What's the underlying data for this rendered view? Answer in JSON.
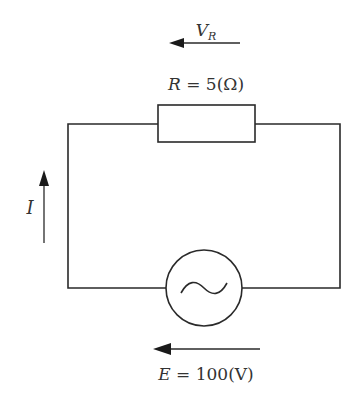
{
  "diagram": {
    "type": "circuit",
    "colors": {
      "line": "#2a2a2a",
      "text": "#333333",
      "background": "#ffffff"
    },
    "labels": {
      "voltage_resistor": {
        "symbol": "V",
        "subscript": "R"
      },
      "resistor": {
        "symbol": "R",
        "equals": " = ",
        "value": "5(Ω)"
      },
      "current": {
        "symbol": "I"
      },
      "source": {
        "symbol": "E",
        "equals": " = ",
        "value": "100(V)"
      }
    },
    "components": [
      {
        "name": "resistor",
        "label": "R = 5(Ω)"
      },
      {
        "name": "ac-voltage-source",
        "label": "E = 100(V)"
      }
    ],
    "arrows": [
      {
        "name": "voltage-resistor-arrow",
        "direction": "left",
        "label": "V_R"
      },
      {
        "name": "current-arrow",
        "direction": "up",
        "label": "I"
      },
      {
        "name": "source-emf-arrow",
        "direction": "left",
        "label": "E"
      }
    ]
  }
}
